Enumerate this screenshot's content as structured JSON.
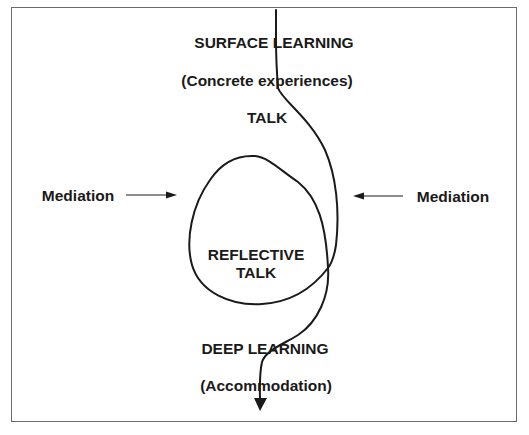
{
  "diagram": {
    "labels": {
      "surface_learning": "SURFACE LEARNING",
      "concrete_experiences": "(Concrete experiences)",
      "talk": "TALK",
      "mediation_left": "Mediation",
      "mediation_right": "Mediation",
      "reflective": "REFLECTIVE",
      "reflective_talk": "TALK",
      "deep_learning": "DEEP LEARNING",
      "accommodation": "(Accommodation)"
    },
    "colors": {
      "line": "#1a1a1a",
      "border": "#6b6b6b",
      "background": "#ffffff"
    }
  }
}
